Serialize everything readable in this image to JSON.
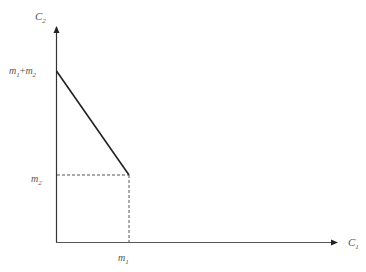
{
  "diagram": {
    "type": "budget-line",
    "axes": {
      "x_label": "C",
      "x_label_sub": "1",
      "y_label": "C",
      "y_label_sub": "2"
    },
    "ticks": {
      "y_top": {
        "a": "m",
        "a_sub": "1",
        "plus": "+",
        "b": "m",
        "b_sub": "2"
      },
      "y_mid": {
        "a": "m",
        "a_sub": "2"
      },
      "x_mid": {
        "a": "m",
        "a_sub": "1"
      }
    },
    "colors": {
      "axis": "#333333",
      "line": "#222222",
      "dash": "#444444",
      "label": "#555555"
    }
  }
}
